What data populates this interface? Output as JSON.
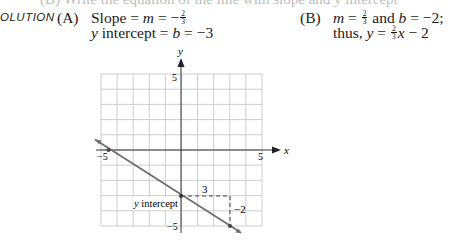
{
  "clipped_line": "(B)   Write the equation of the line with slope and y intercept",
  "section_label": "OLUTION",
  "part_a": {
    "tag": "(A)",
    "line1": {
      "prefix": "Slope = ",
      "var": "m",
      "eq": " = −",
      "frac_num": "2",
      "frac_den": "3"
    },
    "line2": {
      "var_y": "y",
      "text": " intercept = ",
      "var_b": "b",
      "eq": " = −3"
    }
  },
  "part_b": {
    "tag": "(B)",
    "line1": {
      "var_m": "m",
      "eq1": " = ",
      "frac_num": "2",
      "frac_den": "3",
      "and": " and ",
      "var_b": "b",
      "eq2": " = −2;"
    },
    "line2": {
      "thus": "thus, ",
      "var_y": "y",
      "eq": " = ",
      "frac_num": "2",
      "frac_den": "3",
      "var_x": "x",
      "tail": " − 2"
    }
  },
  "graph": {
    "x_axis_label": "x",
    "y_axis_label": "y",
    "x_tick_neg": "−5",
    "x_tick_pos": "5",
    "y_tick_pos": "5",
    "y_tick_neg": "−5",
    "run_label": "3",
    "rise_label": "−2",
    "intercept_label": "y intercept",
    "line_color": "#6e6e6e",
    "grid_color": "#c8c8c8",
    "axis_color": "#333333"
  },
  "chart_data": {
    "type": "line",
    "title": "",
    "xlabel": "x",
    "ylabel": "y",
    "xlim": [
      -5,
      5
    ],
    "ylim": [
      -5,
      5
    ],
    "grid": true,
    "series": [
      {
        "name": "y = -2/3 x - 3",
        "slope": -0.6667,
        "intercept": -3,
        "x": [
          -5.5,
          -4.5,
          0,
          3,
          3.6
        ],
        "y": [
          0.667,
          0,
          -3,
          -5,
          -5.4
        ]
      }
    ],
    "points": [
      {
        "label": "x intercept",
        "x": -4.5,
        "y": 0
      },
      {
        "label": "y intercept",
        "x": 0,
        "y": -3
      },
      {
        "label": "",
        "x": 3,
        "y": -5
      }
    ],
    "annotations": [
      {
        "text": "3",
        "type": "run",
        "from": [
          0,
          -3
        ],
        "to": [
          3,
          -3
        ]
      },
      {
        "text": "−2",
        "type": "rise",
        "from": [
          3,
          -3
        ],
        "to": [
          3,
          -5
        ]
      },
      {
        "text": "y intercept",
        "at": [
          0,
          -3
        ]
      }
    ]
  }
}
